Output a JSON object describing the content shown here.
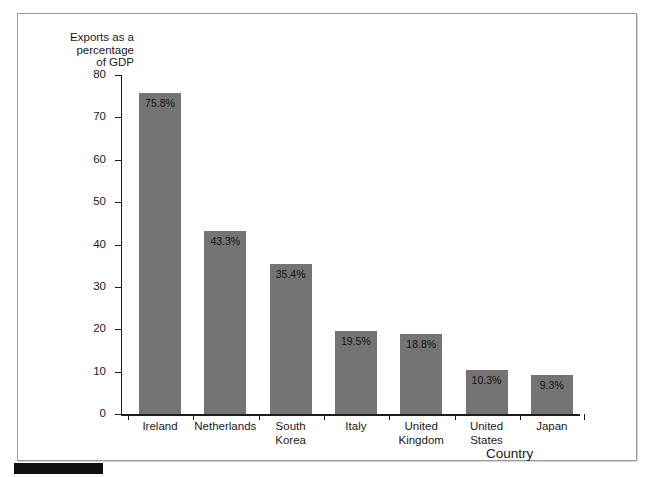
{
  "chart_data": {
    "type": "bar",
    "title": "",
    "subtitle": "",
    "xlabel": "Country",
    "ylabel": "Exports as a\npercentage\nof GDP",
    "ylim": [
      0,
      80
    ],
    "yticks": [
      0,
      10,
      20,
      30,
      40,
      50,
      60,
      70,
      80
    ],
    "ytick_labels": [
      "0",
      "10",
      "20",
      "30",
      "40",
      "50",
      "60",
      "70",
      "80"
    ],
    "grid": false,
    "legend": null,
    "bar_color": "#747474",
    "axis_color": "#1b1b1b",
    "categories": [
      "Ireland",
      "Netherlands",
      "South\nKorea",
      "Italy",
      "United\nKingdom",
      "United\nStates",
      "Japan"
    ],
    "values": [
      75.8,
      43.3,
      35.4,
      19.5,
      18.8,
      10.3,
      9.3
    ],
    "data_labels": [
      "75.8%",
      "43.3%",
      "35.4%",
      "19.5%",
      "18.8%",
      "10.3%",
      "9.3%"
    ]
  },
  "figure": {
    "border_color": "#9a9a9a",
    "background": "#ffffff",
    "marker_color": "#101010"
  }
}
